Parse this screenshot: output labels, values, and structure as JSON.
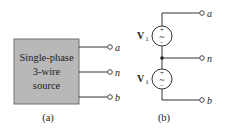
{
  "figure_a": {
    "box": {
      "lines": [
        "Single-phase",
        "3-wire",
        "source"
      ],
      "fill": "#b8b8b8",
      "stroke": "#707070"
    },
    "terminals": [
      {
        "label": "a"
      },
      {
        "label": "n"
      },
      {
        "label": "b"
      }
    ],
    "caption": "(a)"
  },
  "figure_b": {
    "sources": [
      {
        "label": "V",
        "subscript": "1",
        "plus": "+",
        "minus": "−",
        "symbol": "~"
      },
      {
        "label": "V",
        "subscript": "1",
        "plus": "+",
        "minus": "−",
        "symbol": "~"
      }
    ],
    "terminals": [
      {
        "label": "a"
      },
      {
        "label": "n"
      },
      {
        "label": "b"
      }
    ],
    "caption": "(b)"
  },
  "colors": {
    "wire": "#333333",
    "box_fill": "#b8b8b8",
    "box_stroke": "#707070"
  }
}
